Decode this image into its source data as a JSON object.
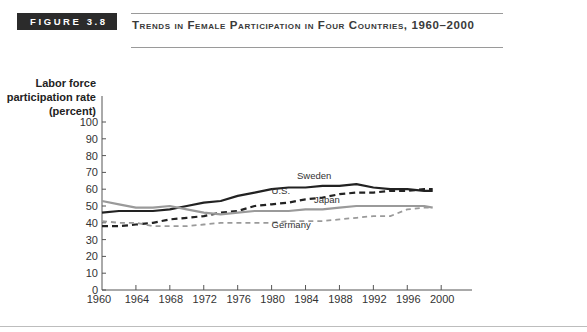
{
  "figure": {
    "label": "FIGURE 3.8",
    "title": "Trends in Female Participation in Four Countries, 1960–2000"
  },
  "axes": {
    "ylabel": "Labor force participation rate (percent)",
    "yticks": [
      0,
      10,
      20,
      30,
      40,
      50,
      60,
      70,
      80,
      90,
      100
    ],
    "xticks": [
      1960,
      1964,
      1968,
      1972,
      1976,
      1980,
      1984,
      1988,
      1992,
      1996,
      2000
    ]
  },
  "colors": {
    "figure_label_bg": "#2b2b2b",
    "sweden": "#222222",
    "us": "#222222",
    "japan": "#9a9a9a",
    "germany": "#9a9a9a"
  },
  "chart_data": {
    "type": "line",
    "title": "Trends in Female Participation in Four Countries, 1960–2000",
    "xlabel": "",
    "ylabel": "Labor force participation rate (percent)",
    "xlim": [
      1960,
      2000
    ],
    "ylim": [
      0,
      100
    ],
    "grid": false,
    "legend": "inline labels",
    "x": [
      1960,
      1962,
      1964,
      1966,
      1968,
      1970,
      1972,
      1974,
      1976,
      1978,
      1980,
      1982,
      1984,
      1986,
      1988,
      1990,
      1992,
      1994,
      1996,
      1998,
      1999
    ],
    "series": [
      {
        "name": "Sweden",
        "style": "solid-dark",
        "values": [
          46,
          47,
          47,
          47,
          48,
          50,
          52,
          53,
          56,
          58,
          60,
          61,
          61,
          62,
          62,
          63,
          61,
          60,
          60,
          59,
          59
        ]
      },
      {
        "name": "U.S.",
        "style": "dashed-dark",
        "values": [
          38,
          38,
          39,
          40,
          42,
          43,
          44,
          46,
          47,
          50,
          51,
          52,
          54,
          55,
          57,
          58,
          58,
          59,
          59,
          60,
          60
        ]
      },
      {
        "name": "Japan",
        "style": "solid-gray",
        "values": [
          53,
          51,
          49,
          49,
          50,
          48,
          46,
          45,
          46,
          47,
          47,
          47,
          48,
          48,
          49,
          50,
          50,
          50,
          50,
          50,
          49
        ]
      },
      {
        "name": "Germany",
        "style": "dashed-gray",
        "values": [
          41,
          40,
          40,
          38,
          38,
          38,
          39,
          40,
          40,
          40,
          40,
          41,
          41,
          41,
          42,
          43,
          44,
          44,
          48,
          49,
          49
        ]
      }
    ],
    "annotations": [
      {
        "text": "Sweden",
        "x": 1983,
        "y": 66
      },
      {
        "text": "U.S.",
        "x": 1980,
        "y": 57
      },
      {
        "text": "Japan",
        "x": 1985,
        "y": 52
      },
      {
        "text": "Germany",
        "x": 1980,
        "y": 37
      }
    ]
  }
}
